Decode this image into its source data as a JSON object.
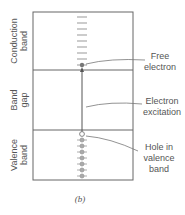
{
  "diagram": {
    "regions": [
      {
        "id": "conduction",
        "label_line1": "Conduction",
        "label_line2": "band"
      },
      {
        "id": "gap",
        "label_line1": "Band",
        "label_line2": "gap"
      },
      {
        "id": "valence",
        "label_line1": "Valence",
        "label_line2": "band"
      }
    ],
    "annotations": [
      {
        "id": "free-electron",
        "line1": "Free",
        "line2": "electron"
      },
      {
        "id": "electron-excitation",
        "line1": "Electron",
        "line2": "excitation"
      },
      {
        "id": "hole",
        "line1": "Hole in",
        "line2": "valence",
        "line3": "band"
      }
    ],
    "caption": "(b)",
    "colors": {
      "stroke": "#666666",
      "text": "#555555",
      "electron": "#999999"
    }
  }
}
